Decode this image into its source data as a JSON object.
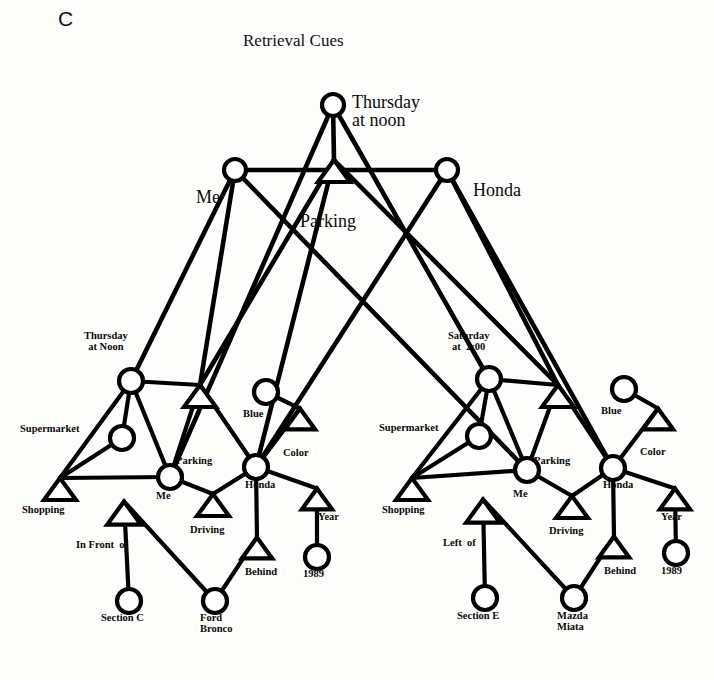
{
  "figure": {
    "panel_letter": "C",
    "title": "Retrieval Cues",
    "width": 714,
    "height": 680,
    "background_color": "#fdfdfc",
    "ink_color": "#000000",
    "node_fill": "#ffffff"
  },
  "legend": {
    "circle_meaning": "entity node",
    "triangle_meaning": "relation node"
  },
  "cue_layer": {
    "name": "Retrieval Cues",
    "nodes": [
      {
        "id": "cue_thursday",
        "shape": "circle",
        "label": "Thursday\nat noon",
        "label_pos": "right",
        "x": 333,
        "y": 105,
        "r": 11,
        "label_x": 352,
        "label_y": 93,
        "label_size": "big"
      },
      {
        "id": "cue_me",
        "shape": "circle",
        "label": "Me",
        "label_pos": "left",
        "x": 235,
        "y": 170,
        "r": 11,
        "label_x": 196,
        "label_y": 188,
        "label_size": "big"
      },
      {
        "id": "cue_honda",
        "shape": "circle",
        "label": "Honda",
        "label_pos": "right",
        "x": 447,
        "y": 170,
        "r": 11,
        "label_x": 473,
        "label_y": 181,
        "label_size": "big"
      },
      {
        "id": "cue_parking",
        "shape": "triangle",
        "label": "Parking",
        "label_pos": "below",
        "x": 334,
        "y": 171,
        "size": 20,
        "label_x": 300,
        "label_y": 212,
        "label_size": "big"
      }
    ]
  },
  "memory_left": {
    "name": "Thursday episode",
    "nodes": [
      {
        "id": "L_thursday",
        "shape": "circle",
        "label": "Thursday\nat Noon",
        "x": 131,
        "y": 381,
        "r": 12,
        "label_x": 84,
        "label_y": 331,
        "label_size": "sm",
        "align": "center"
      },
      {
        "id": "L_supermarket",
        "shape": "circle",
        "label": "Supermarket",
        "x": 122,
        "y": 438,
        "r": 12,
        "label_x": 20,
        "label_y": 424,
        "label_size": "sm"
      },
      {
        "id": "L_parking",
        "shape": "triangle",
        "label": "Parking",
        "x": 200,
        "y": 396,
        "size": 20,
        "label_x": 176,
        "label_y": 456,
        "label_size": "sm"
      },
      {
        "id": "L_shopping",
        "shape": "triangle",
        "label": "Shopping",
        "x": 60,
        "y": 489,
        "size": 20,
        "label_x": 22,
        "label_y": 505,
        "label_size": "sm"
      },
      {
        "id": "L_me",
        "shape": "circle",
        "label": "Me",
        "x": 170,
        "y": 477,
        "r": 12,
        "label_x": 156,
        "label_y": 491,
        "label_size": "sm"
      },
      {
        "id": "L_blue",
        "shape": "circle",
        "label": "Blue",
        "x": 266,
        "y": 392,
        "r": 12,
        "label_x": 243,
        "label_y": 409,
        "label_size": "sm"
      },
      {
        "id": "L_color",
        "shape": "triangle",
        "label": "Color",
        "x": 300,
        "y": 419,
        "size": 19,
        "label_x": 283,
        "label_y": 448,
        "label_size": "sm"
      },
      {
        "id": "L_honda",
        "shape": "circle",
        "label": "Honda",
        "x": 256,
        "y": 467,
        "r": 12,
        "label_x": 245,
        "label_y": 480,
        "label_size": "sm"
      },
      {
        "id": "L_driving",
        "shape": "triangle",
        "label": "Driving",
        "x": 213,
        "y": 505,
        "size": 20,
        "label_x": 190,
        "label_y": 525,
        "label_size": "sm"
      },
      {
        "id": "L_year",
        "shape": "triangle",
        "label": "Year",
        "x": 317,
        "y": 499,
        "size": 19,
        "label_x": 318,
        "label_y": 512,
        "label_size": "sm"
      },
      {
        "id": "L_infrontof",
        "shape": "triangle",
        "label": "In Front  of",
        "x": 124,
        "y": 513,
        "size": 21,
        "label_x": 76,
        "label_y": 540,
        "label_size": "sm"
      },
      {
        "id": "L_behind",
        "shape": "triangle",
        "label": "Behind",
        "x": 257,
        "y": 548,
        "size": 19,
        "label_x": 245,
        "label_y": 567,
        "label_size": "sm"
      },
      {
        "id": "L_1989",
        "shape": "circle",
        "label": "1989",
        "x": 317,
        "y": 557,
        "r": 12,
        "label_x": 303,
        "label_y": 569,
        "label_size": "sm"
      },
      {
        "id": "L_sectionC",
        "shape": "circle",
        "label": "Section C",
        "x": 129,
        "y": 601,
        "r": 12,
        "label_x": 101,
        "label_y": 613,
        "label_size": "sm"
      },
      {
        "id": "L_ford",
        "shape": "circle",
        "label": "Ford\nBronco",
        "x": 215,
        "y": 601,
        "r": 12,
        "label_x": 200,
        "label_y": 613,
        "label_size": "sm"
      }
    ],
    "edges": [
      [
        "L_thursday",
        "L_supermarket"
      ],
      [
        "L_thursday",
        "L_shopping"
      ],
      [
        "L_thursday",
        "L_parking"
      ],
      [
        "L_thursday",
        "L_me"
      ],
      [
        "L_supermarket",
        "L_shopping"
      ],
      [
        "L_shopping",
        "L_me"
      ],
      [
        "L_parking",
        "L_honda"
      ],
      [
        "L_parking",
        "L_me"
      ],
      [
        "L_me",
        "L_driving"
      ],
      [
        "L_honda",
        "L_driving"
      ],
      [
        "L_blue",
        "L_color"
      ],
      [
        "L_color",
        "L_honda"
      ],
      [
        "L_honda",
        "L_year"
      ],
      [
        "L_year",
        "L_1989"
      ],
      [
        "L_honda",
        "L_behind"
      ],
      [
        "L_behind",
        "L_ford"
      ],
      [
        "L_infrontof",
        "L_sectionC"
      ],
      [
        "L_infrontof",
        "L_ford"
      ]
    ]
  },
  "memory_right": {
    "name": "Saturday episode",
    "nodes": [
      {
        "id": "R_saturday",
        "shape": "circle",
        "label": "Saturday\nat  2:00",
        "x": 489,
        "y": 379,
        "r": 12,
        "label_x": 448,
        "label_y": 331,
        "label_size": "sm",
        "align": "center"
      },
      {
        "id": "R_supermarket",
        "shape": "circle",
        "label": "Supermarket",
        "x": 479,
        "y": 436,
        "r": 12,
        "label_x": 379,
        "label_y": 423,
        "label_size": "sm"
      },
      {
        "id": "R_parking",
        "shape": "triangle",
        "label": "Parking",
        "x": 558,
        "y": 396,
        "size": 20,
        "label_x": 534,
        "label_y": 456,
        "label_size": "sm"
      },
      {
        "id": "R_shopping",
        "shape": "triangle",
        "label": "Shopping",
        "x": 412,
        "y": 489,
        "size": 20,
        "label_x": 382,
        "label_y": 505,
        "label_size": "sm"
      },
      {
        "id": "R_me",
        "shape": "circle",
        "label": "Me",
        "x": 527,
        "y": 470,
        "r": 12,
        "label_x": 513,
        "label_y": 489,
        "label_size": "sm"
      },
      {
        "id": "R_blue",
        "shape": "circle",
        "label": "Blue",
        "x": 624,
        "y": 389,
        "r": 12,
        "label_x": 601,
        "label_y": 406,
        "label_size": "sm"
      },
      {
        "id": "R_color",
        "shape": "triangle",
        "label": "Color",
        "x": 658,
        "y": 419,
        "size": 19,
        "label_x": 640,
        "label_y": 447,
        "label_size": "sm"
      },
      {
        "id": "R_honda",
        "shape": "circle",
        "label": "Honda",
        "x": 613,
        "y": 468,
        "r": 12,
        "label_x": 603,
        "label_y": 480,
        "label_size": "sm"
      },
      {
        "id": "R_driving",
        "shape": "triangle",
        "label": "Driving",
        "x": 572,
        "y": 507,
        "size": 20,
        "label_x": 549,
        "label_y": 526,
        "label_size": "sm"
      },
      {
        "id": "R_year",
        "shape": "triangle",
        "label": "Year",
        "x": 675,
        "y": 499,
        "size": 19,
        "label_x": 661,
        "label_y": 512,
        "label_size": "sm"
      },
      {
        "id": "R_leftof",
        "shape": "triangle",
        "label": "Left  of",
        "x": 483,
        "y": 511,
        "size": 21,
        "label_x": 443,
        "label_y": 538,
        "label_size": "sm"
      },
      {
        "id": "R_behind",
        "shape": "triangle",
        "label": "Behind",
        "x": 614,
        "y": 547,
        "size": 19,
        "label_x": 604,
        "label_y": 566,
        "label_size": "sm"
      },
      {
        "id": "R_1989",
        "shape": "circle",
        "label": "1989",
        "x": 676,
        "y": 553,
        "r": 12,
        "label_x": 661,
        "label_y": 566,
        "label_size": "sm"
      },
      {
        "id": "R_sectionE",
        "shape": "circle",
        "label": "Section E",
        "x": 485,
        "y": 598,
        "r": 12,
        "label_x": 457,
        "label_y": 611,
        "label_size": "sm"
      },
      {
        "id": "R_mazda",
        "shape": "circle",
        "label": "Mazda\nMiata",
        "x": 574,
        "y": 598,
        "r": 12,
        "label_x": 557,
        "label_y": 611,
        "label_size": "sm"
      }
    ],
    "edges": [
      [
        "R_saturday",
        "R_supermarket"
      ],
      [
        "R_saturday",
        "R_shopping"
      ],
      [
        "R_saturday",
        "R_parking"
      ],
      [
        "R_saturday",
        "R_me"
      ],
      [
        "R_supermarket",
        "R_shopping"
      ],
      [
        "R_shopping",
        "R_me"
      ],
      [
        "R_parking",
        "R_honda"
      ],
      [
        "R_parking",
        "R_me"
      ],
      [
        "R_me",
        "R_driving"
      ],
      [
        "R_honda",
        "R_driving"
      ],
      [
        "R_blue",
        "R_color"
      ],
      [
        "R_color",
        "R_honda"
      ],
      [
        "R_honda",
        "R_year"
      ],
      [
        "R_year",
        "R_1989"
      ],
      [
        "R_honda",
        "R_behind"
      ],
      [
        "R_behind",
        "R_mazda"
      ],
      [
        "R_leftof",
        "R_sectionE"
      ],
      [
        "R_leftof",
        "R_mazda"
      ]
    ]
  },
  "cue_links": {
    "description": "edges from retrieval cue nodes down into both memory traces",
    "edges": [
      [
        "cue_thursday",
        "cue_parking"
      ],
      [
        "cue_me",
        "cue_honda"
      ],
      [
        "cue_thursday",
        "L_me"
      ],
      [
        "cue_me",
        "L_thursday"
      ],
      [
        "cue_me",
        "L_parking"
      ],
      [
        "cue_parking",
        "L_parking"
      ],
      [
        "cue_parking",
        "L_honda"
      ],
      [
        "cue_honda",
        "L_honda"
      ],
      [
        "cue_me",
        "R_me"
      ],
      [
        "cue_parking",
        "R_parking"
      ],
      [
        "cue_honda",
        "R_parking"
      ],
      [
        "cue_honda",
        "R_honda"
      ],
      [
        "cue_thursday",
        "R_saturday"
      ]
    ]
  }
}
